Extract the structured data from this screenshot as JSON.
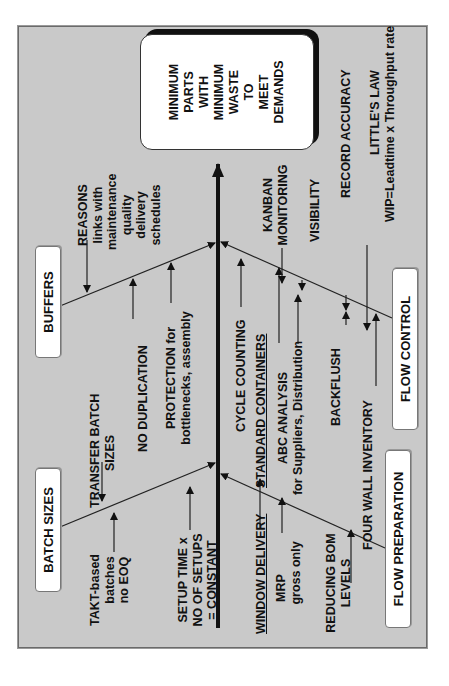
{
  "diagram": {
    "type": "fishbone",
    "orientation": "rotated-90-ccw",
    "colors": {
      "background": "#c9c9c9",
      "box_fill": "#ffffff",
      "ink": "#111111",
      "effect_shadow": "#111111"
    },
    "effect": {
      "lines": [
        "MINIMUM",
        "PARTS",
        "WITH",
        "MINIMUM",
        "WASTE",
        "TO",
        "MEET",
        "DEMANDS"
      ]
    },
    "categories": {
      "batch_sizes": {
        "label": "BATCH SIZES",
        "causes": {
          "takt": [
            "TAKT-based",
            "batches",
            "no EOQ"
          ],
          "transfer": [
            "TRANSFER BATCH",
            "SIZES"
          ],
          "setup": [
            "SETUP TIME x",
            "NO OF SETUPS",
            "= CONSTANT"
          ]
        }
      },
      "buffers": {
        "label": "BUFFERS",
        "causes": {
          "reasons": [
            "REASONS",
            "links with",
            "maintenance",
            "quality",
            "delivery",
            "schedules"
          ],
          "no_dup": "NO DUPLICATION",
          "protection": [
            "PROTECTION for",
            "bottlenecks, assembly"
          ]
        }
      },
      "flow_preparation": {
        "label": "FLOW PREPARATION",
        "causes": {
          "window": "WINDOW DELIVERY",
          "mrp": [
            "MRP",
            "gross only"
          ],
          "bom": [
            "REDUCING BOM",
            "LEVELS"
          ]
        }
      },
      "flow_control": {
        "label": "FLOW CONTROL",
        "causes": {
          "cycle": "CYCLE COUNTING",
          "standard": "STANDARD CONTAINERS",
          "abc": [
            "ABC ANALYSIS",
            "for Suppliers, Distribution"
          ],
          "backflush": "BACKFLUSH",
          "fourwall": "FOUR WALL INVENTORY",
          "kanban": [
            "KANBAN",
            "MONITORING"
          ],
          "visibility": "VISIBILITY",
          "record": "RECORD ACCURACY",
          "little": [
            "LITTLE'S LAW",
            "WIP=Leadtime x Throughput rate"
          ]
        }
      }
    }
  }
}
